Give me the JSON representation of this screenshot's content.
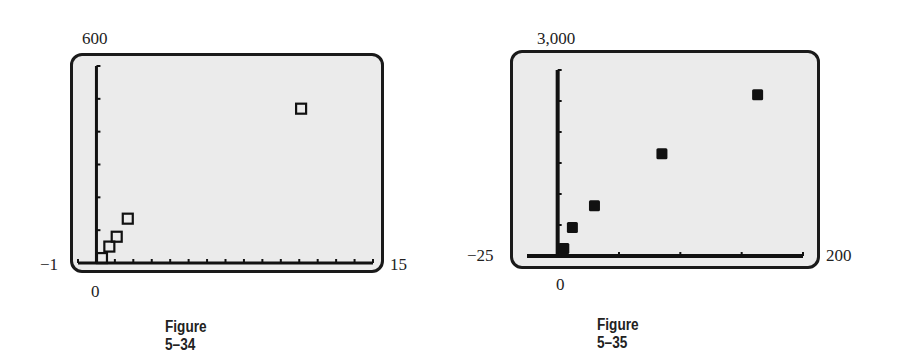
{
  "chart_data": [
    {
      "type": "scatter",
      "title": "",
      "caption": "Figure 5–34",
      "xlabel": "",
      "ylabel": "",
      "xlim": [
        -1,
        15
      ],
      "ylim": [
        0,
        600
      ],
      "window_labels": {
        "ymax": "600",
        "xmin": "−1",
        "xmax": "15",
        "origin": "0"
      },
      "marker": "hollow-square",
      "grid": false,
      "x_ticks_every": 1,
      "y_ticks_every": 100,
      "points": [
        {
          "x": 0.3,
          "y": 15
        },
        {
          "x": 0.7,
          "y": 50
        },
        {
          "x": 1.1,
          "y": 80
        },
        {
          "x": 1.7,
          "y": 135
        },
        {
          "x": 11.1,
          "y": 470
        }
      ]
    },
    {
      "type": "scatter",
      "title": "",
      "caption": "Figure 5–35",
      "xlabel": "",
      "ylabel": "",
      "xlim": [
        -25,
        200
      ],
      "ylim": [
        0,
        3000
      ],
      "window_labels": {
        "ymax": "3,000",
        "xmin": "−25",
        "xmax": "200",
        "origin": "0"
      },
      "marker": "filled-square",
      "grid": false,
      "x_ticks_every": 50,
      "y_ticks_every": 500,
      "points": [
        {
          "x": 5,
          "y": 120
        },
        {
          "x": 12,
          "y": 460
        },
        {
          "x": 30,
          "y": 810
        },
        {
          "x": 85,
          "y": 1650
        },
        {
          "x": 163,
          "y": 2600
        }
      ]
    }
  ],
  "figures": [
    {
      "caption": "Figure 5–34",
      "ymax": "600",
      "xmin": "−1",
      "xmax": "15",
      "origin": "0"
    },
    {
      "caption": "Figure 5–35",
      "ymax": "3,000",
      "xmin": "−25",
      "xmax": "200",
      "origin": "0"
    }
  ]
}
